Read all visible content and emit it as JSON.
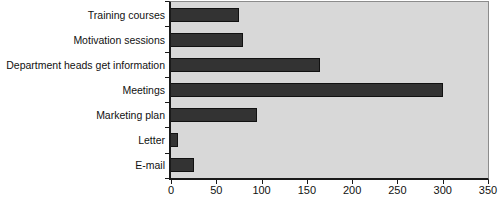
{
  "chart_data": {
    "type": "bar",
    "orientation": "horizontal",
    "title": "",
    "xlabel": "",
    "ylabel": "",
    "categories": [
      "Training courses",
      "Motivation sessions",
      "Department heads get information",
      "Meetings",
      "Marketing plan",
      "Letter",
      "E-mail"
    ],
    "values": [
      75,
      80,
      165,
      300,
      95,
      8,
      25
    ],
    "xlim": [
      0,
      350
    ],
    "x_ticks": [
      0,
      50,
      100,
      150,
      200,
      250,
      300,
      350
    ],
    "grid": false,
    "legend": false,
    "colors": {
      "bar_fill": "#333333",
      "bar_border": "#111111",
      "plot_background": "#d8d8d8",
      "plot_border": "#8c8c8c",
      "axis_line": "#1a1a1a",
      "text": "#111111",
      "page_background": "#ffffff"
    }
  }
}
